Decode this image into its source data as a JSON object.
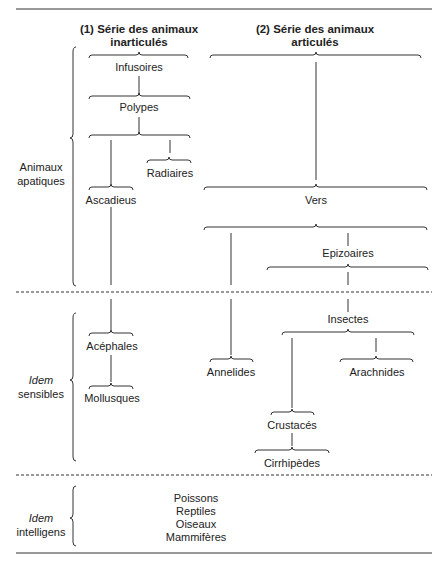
{
  "headers": {
    "col1_line1": "(1) Série des animaux",
    "col1_line2": "inarticulés",
    "col2_line1": "(2) Série des animaux",
    "col2_line2": "articulés"
  },
  "sections": [
    {
      "line1": "Animaux",
      "line2": "apatiques"
    },
    {
      "line1": "Idem",
      "line2": "sensibles"
    },
    {
      "line1": "Idem",
      "line2": "intelligens"
    }
  ],
  "series1": {
    "infusoires": "Infusoires",
    "polypes": "Polypes",
    "radiaires": "Radiaires",
    "ascadieus": "Ascadieus",
    "acephales": "Acéphales",
    "mollusques": "Mollusques"
  },
  "series2": {
    "vers": "Vers",
    "epizoaires": "Epizoaires",
    "insectes": "Insectes",
    "annelides": "Annelides",
    "arachnides": "Arachnides",
    "crustaces": "Crustacés",
    "cirrhipedes": "Cirrhipèdes"
  },
  "vertebrates": [
    "Poissons",
    "Reptiles",
    "Oiseaux",
    "Mammifères"
  ]
}
